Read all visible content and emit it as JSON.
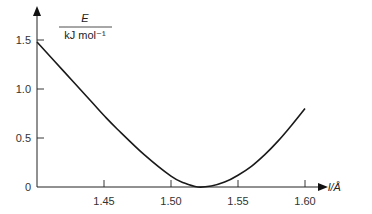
{
  "chart_data": {
    "type": "line",
    "title": "",
    "xlabel": "l/Å",
    "ylabel_numerator": "E",
    "ylabel_denominator": "kJ mol⁻¹",
    "xlim": [
      1.4,
      1.62
    ],
    "ylim": [
      0,
      1.6
    ],
    "x_ticks": [
      1.45,
      1.5,
      1.55,
      1.6
    ],
    "x_tick_labels": [
      "1.45",
      "1.50",
      "1.55",
      "1.60"
    ],
    "y_ticks": [
      0,
      0.5,
      1.0,
      1.5
    ],
    "y_tick_labels": [
      "0",
      "0.5",
      "1.0",
      "1.5"
    ],
    "grid": false,
    "legend": null,
    "series": [
      {
        "name": "E",
        "x": [
          1.4,
          1.42,
          1.44,
          1.45,
          1.46,
          1.48,
          1.5,
          1.51,
          1.52,
          1.53,
          1.54,
          1.55,
          1.56,
          1.57,
          1.58,
          1.59,
          1.6
        ],
        "values": [
          1.48,
          1.18,
          0.88,
          0.73,
          0.59,
          0.33,
          0.11,
          0.04,
          0.0,
          0.01,
          0.05,
          0.12,
          0.21,
          0.33,
          0.47,
          0.63,
          0.8
        ]
      }
    ],
    "minimum": {
      "x": 1.52,
      "y": 0
    }
  }
}
